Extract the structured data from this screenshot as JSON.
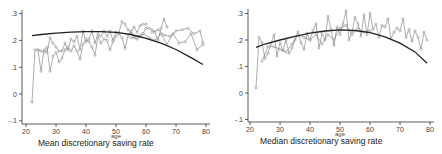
{
  "chart_data": [
    {
      "type": "line",
      "title": "Mean discretionary saving rate",
      "xlabel": "age",
      "ylabel": "",
      "xlim": [
        20,
        80
      ],
      "ylim": [
        -0.1,
        0.3
      ],
      "xticks": [
        "20",
        "30",
        "40",
        "50",
        "60",
        "70",
        "80"
      ],
      "yticks": [
        "-.1",
        "0",
        ".1",
        ".2",
        ".3"
      ],
      "grid": false,
      "legend": "none",
      "fit": {
        "name": "quadratic fit",
        "x": [
          22,
          25,
          30,
          35,
          40,
          45,
          50,
          55,
          60,
          65,
          70,
          75,
          79
        ],
        "y": [
          0.218,
          0.222,
          0.227,
          0.231,
          0.233,
          0.233,
          0.23,
          0.222,
          0.208,
          0.19,
          0.166,
          0.136,
          0.11
        ]
      },
      "series": [
        {
          "name": "cohort-a",
          "x": [
            22,
            23,
            24,
            25,
            26,
            27,
            28,
            29,
            30,
            31,
            32,
            33,
            34,
            35,
            36,
            37,
            38,
            39,
            40,
            41,
            42,
            43,
            44,
            45,
            46,
            47,
            48,
            49,
            50,
            51,
            52,
            53,
            54,
            55,
            56,
            57,
            58,
            59,
            60
          ],
          "y": [
            -0.03,
            0.165,
            0.165,
            0.085,
            0.165,
            0.155,
            0.21,
            0.19,
            0.175,
            0.16,
            0.16,
            0.19,
            0.165,
            0.205,
            0.195,
            0.215,
            0.165,
            0.235,
            0.195,
            0.205,
            0.235,
            0.19,
            0.225,
            0.215,
            0.235,
            0.215,
            0.235,
            0.2,
            0.23,
            0.23,
            0.27,
            0.26,
            0.24,
            0.23,
            0.25,
            0.23,
            0.255,
            0.26,
            0.26
          ]
        },
        {
          "name": "cohort-b",
          "x": [
            24,
            25,
            26,
            27,
            28,
            29,
            30,
            31,
            32,
            33,
            34,
            35,
            36,
            37,
            38,
            39,
            40,
            41,
            42,
            43,
            44,
            45,
            46,
            47,
            48,
            49,
            50,
            51,
            52,
            53,
            54,
            55,
            56,
            57,
            58,
            59,
            60,
            61,
            62,
            63,
            64,
            65,
            66,
            67
          ],
          "y": [
            0.165,
            0.16,
            0.155,
            0.175,
            0.085,
            0.14,
            0.155,
            0.12,
            0.135,
            0.165,
            0.175,
            0.16,
            0.18,
            0.16,
            0.13,
            0.185,
            0.205,
            0.195,
            0.175,
            0.145,
            0.215,
            0.19,
            0.205,
            0.2,
            0.165,
            0.195,
            0.215,
            0.225,
            0.21,
            0.17,
            0.215,
            0.235,
            0.21,
            0.205,
            0.215,
            0.225,
            0.245,
            0.245,
            0.24,
            0.23,
            0.2,
            0.245,
            0.28,
            0.25
          ]
        },
        {
          "name": "cohort-c",
          "x": [
            55,
            57,
            59,
            61,
            63,
            65,
            67,
            69,
            71,
            73,
            75,
            77,
            79
          ],
          "y": [
            0.21,
            0.215,
            0.225,
            0.21,
            0.2,
            0.225,
            0.185,
            0.225,
            0.19,
            0.195,
            0.225,
            0.165,
            0.185
          ]
        },
        {
          "name": "cohort-d",
          "x": [
            62,
            64,
            66,
            68,
            70,
            72,
            74,
            76,
            78,
            79
          ],
          "y": [
            0.23,
            0.24,
            0.22,
            0.215,
            0.235,
            0.24,
            0.245,
            0.225,
            0.235,
            0.19
          ]
        }
      ]
    },
    {
      "type": "line",
      "title": "Median discretionary saving rate",
      "xlabel": "age",
      "ylabel": "",
      "xlim": [
        20,
        80
      ],
      "ylim": [
        -0.1,
        0.3
      ],
      "xticks": [
        "20",
        "30",
        "40",
        "50",
        "60",
        "70",
        "80"
      ],
      "yticks": [
        "-.1",
        "0",
        ".1",
        ".2",
        ".3"
      ],
      "grid": false,
      "legend": "none",
      "fit": {
        "name": "quadratic fit",
        "x": [
          22,
          25,
          30,
          35,
          40,
          45,
          50,
          55,
          60,
          65,
          70,
          75,
          79
        ],
        "y": [
          0.172,
          0.185,
          0.2,
          0.214,
          0.226,
          0.234,
          0.238,
          0.236,
          0.228,
          0.212,
          0.188,
          0.155,
          0.112
        ]
      },
      "series": [
        {
          "name": "cohort-all",
          "x": [
            22,
            23,
            24,
            25,
            26,
            27,
            28,
            29,
            30,
            31,
            32,
            33,
            34,
            35,
            36,
            37,
            38,
            39,
            40,
            41,
            42,
            43,
            44,
            45,
            46,
            47,
            48,
            49,
            50,
            51,
            52,
            53,
            54,
            55,
            56,
            57,
            58,
            59,
            60,
            61,
            62,
            63,
            64,
            65,
            66,
            67,
            68,
            69,
            70,
            71,
            72,
            73,
            74,
            75,
            76,
            77,
            78,
            79
          ],
          "y": [
            0.02,
            0.21,
            0.19,
            0.13,
            0.15,
            0.185,
            0.22,
            0.14,
            0.19,
            0.16,
            0.2,
            0.15,
            0.17,
            0.2,
            0.23,
            0.19,
            0.165,
            0.225,
            0.2,
            0.235,
            0.26,
            0.17,
            0.225,
            0.2,
            0.29,
            0.24,
            0.18,
            0.25,
            0.22,
            0.26,
            0.31,
            0.2,
            0.23,
            0.285,
            0.26,
            0.215,
            0.295,
            0.22,
            0.3,
            0.24,
            0.26,
            0.21,
            0.255,
            0.25,
            0.28,
            0.205,
            0.23,
            0.245,
            0.235,
            0.28,
            0.21,
            0.24,
            0.195,
            0.235,
            0.21,
            0.165,
            0.23,
            0.2
          ]
        },
        {
          "name": "cohort-b",
          "x": [
            24,
            26,
            28,
            30,
            32,
            34,
            36,
            38,
            40,
            42,
            44,
            46,
            48,
            50,
            52,
            54,
            56,
            58,
            60
          ],
          "y": [
            0.12,
            0.175,
            0.175,
            0.165,
            0.155,
            0.185,
            0.22,
            0.21,
            0.2,
            0.22,
            0.185,
            0.22,
            0.2,
            0.245,
            0.255,
            0.22,
            0.245,
            0.23,
            0.235
          ]
        }
      ]
    }
  ]
}
